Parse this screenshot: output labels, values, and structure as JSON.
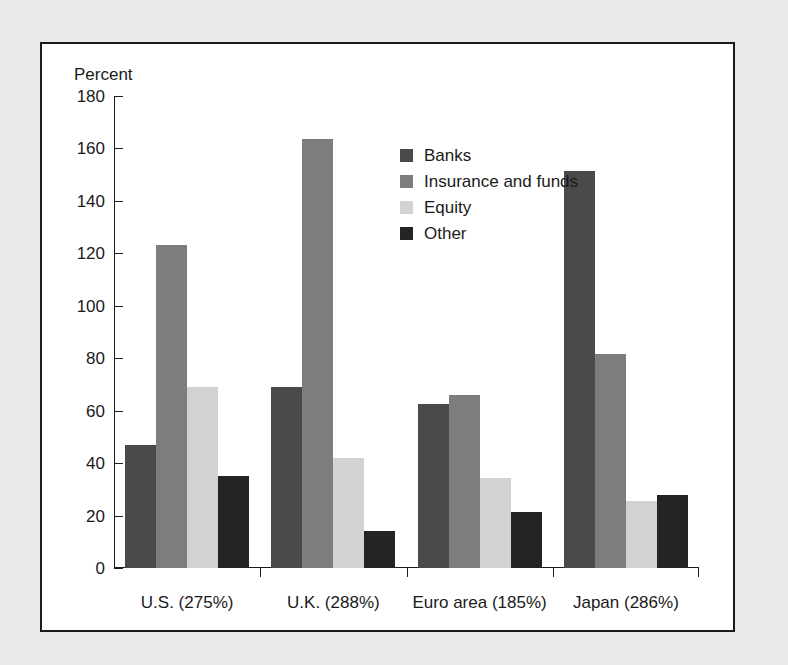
{
  "chart_data": {
    "type": "bar",
    "title": "",
    "subtitle": "",
    "xlabel": "",
    "ylabel": "Percent",
    "ylim": [
      0,
      180
    ],
    "yticks": [
      0,
      20,
      40,
      60,
      80,
      100,
      120,
      140,
      160,
      180
    ],
    "ytick_labels": [
      "0",
      "20",
      "40",
      "60",
      "80",
      "100",
      "120",
      "140",
      "160",
      "180"
    ],
    "grid": false,
    "legend_position": "upper center",
    "categories": [
      "U.S. (275%)",
      "U.K. (288%)",
      "Euro area (185%)",
      "Japan (286%)"
    ],
    "series": [
      {
        "name": "Banks",
        "color": "#4a4a4a",
        "values": [
          47,
          69,
          62.5,
          151.5
        ]
      },
      {
        "name": "Insurance and funds",
        "color": "#7d7d7d",
        "values": [
          123,
          163.5,
          66,
          81.5
        ]
      },
      {
        "name": "Equity",
        "color": "#d2d2d2",
        "values": [
          69,
          42,
          34.5,
          25.5
        ]
      },
      {
        "name": "Other",
        "color": "#242424",
        "values": [
          35,
          14,
          21.5,
          28
        ]
      }
    ]
  },
  "figure": {
    "background_color": "#e9e9e9",
    "panel_color": "#ffffff",
    "border_color": "#1c1c1c",
    "text_color": "#1a1a1a"
  }
}
